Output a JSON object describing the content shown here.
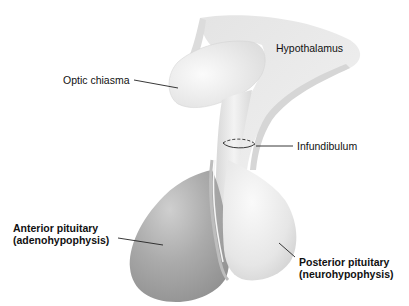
{
  "diagram": {
    "type": "anatomical-illustration",
    "labels": {
      "hypothalamus": "Hypothalamus",
      "optic_chiasma": "Optic chiasma",
      "infundibulum": "Infundibulum",
      "anterior_pituitary": {
        "line1": "Anterior pituitary",
        "line2": "(adenohypophysis)"
      },
      "posterior_pituitary": {
        "line1": "Posterior pituitary",
        "line2": "(neurohypophysis)"
      }
    },
    "colors": {
      "background": "#ffffff",
      "hypothalamus_fill": "#ececec",
      "anterior_fill": "#a9a9a9",
      "posterior_fill": "#e6e6e6",
      "leader_line": "#222222"
    }
  }
}
